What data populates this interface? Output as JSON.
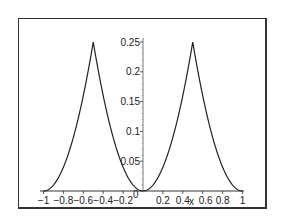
{
  "chart_data": {
    "type": "line",
    "title": "",
    "xlabel": "x",
    "ylabel": "",
    "xlim": [
      -1,
      1
    ],
    "ylim": [
      0,
      0.25
    ],
    "grid": false,
    "legend": null,
    "x_ticks": [
      "-1",
      "-0.8",
      "-0.6",
      "-0.4",
      "-0.2",
      "0",
      "0.2",
      "0.4",
      "0.6",
      "0.8",
      "1"
    ],
    "y_ticks": [
      "0.05",
      "0.1",
      "0.15",
      "0.2",
      "0.25"
    ],
    "series": [
      {
        "name": "f(x)",
        "x": [
          -1,
          -0.9,
          -0.8,
          -0.7,
          -0.6,
          -0.5,
          -0.4,
          -0.3,
          -0.2,
          -0.1,
          0,
          0.1,
          0.2,
          0.3,
          0.4,
          0.5,
          0.6,
          0.7,
          0.8,
          0.9,
          1
        ],
        "values": [
          0,
          0.01,
          0.04,
          0.09,
          0.16,
          0.25,
          0.16,
          0.09,
          0.04,
          0.01,
          0,
          0.01,
          0.04,
          0.09,
          0.16,
          0.25,
          0.16,
          0.09,
          0.04,
          0.01,
          0
        ]
      }
    ]
  },
  "axis": {
    "x_label": "x",
    "origin_label": "0",
    "x_tick_labels": [
      "-1",
      "-0.8",
      "-0.6",
      "-0.4",
      "-0.2",
      "0.2",
      "0.4",
      "0.6",
      "0.8",
      "1"
    ],
    "y_tick_labels": [
      "0.05",
      "0.1",
      "0.15",
      "0.2",
      "0.25"
    ]
  }
}
